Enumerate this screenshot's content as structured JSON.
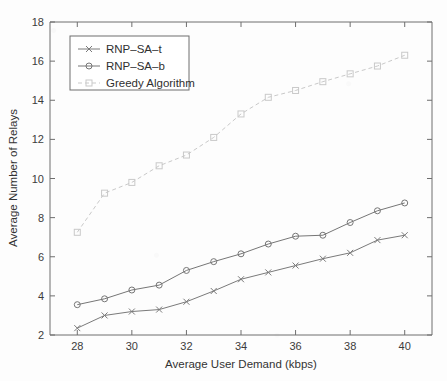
{
  "chart_data": {
    "type": "line",
    "title": "",
    "subtitle": "",
    "xlabel": "Average User Demand (kbps)",
    "ylabel": "Average Number of Relays",
    "x": [
      28,
      29,
      30,
      31,
      32,
      33,
      34,
      35,
      36,
      37,
      38,
      39,
      40
    ],
    "xlim": [
      27,
      41
    ],
    "ylim": [
      2,
      18
    ],
    "xticks": [
      28,
      30,
      32,
      34,
      36,
      38,
      40
    ],
    "yticks": [
      2,
      4,
      6,
      8,
      10,
      12,
      14,
      16,
      18
    ],
    "xticklabels": [
      "28",
      "30",
      "32",
      "34",
      "36",
      "38",
      "40"
    ],
    "yticklabels": [
      "2",
      "4",
      "6",
      "8",
      "10",
      "12",
      "14",
      "16",
      "18"
    ],
    "grid": false,
    "legend_position": "upper left",
    "series": [
      {
        "name": "RNP–SA–t",
        "marker": "x",
        "linestyle": "solid",
        "color": "#7a7a7a",
        "values": [
          2.35,
          3.0,
          3.2,
          3.3,
          3.7,
          4.25,
          4.85,
          5.2,
          5.55,
          5.9,
          6.2,
          6.85,
          7.1
        ]
      },
      {
        "name": "RNP–SA–b",
        "marker": "circle",
        "linestyle": "solid",
        "color": "#767676",
        "values": [
          3.55,
          3.85,
          4.3,
          4.55,
          5.3,
          5.75,
          6.15,
          6.65,
          7.05,
          7.1,
          7.75,
          8.35,
          8.75
        ]
      },
      {
        "name": "Greedy Algorithm",
        "marker": "square",
        "linestyle": "dashed",
        "color": "#c9c9c9",
        "values": [
          7.25,
          9.25,
          9.8,
          10.65,
          11.2,
          12.1,
          13.3,
          14.15,
          14.5,
          14.95,
          15.35,
          15.75,
          16.3
        ]
      }
    ]
  },
  "legend": {
    "entries": [
      {
        "label": "RNP–SA–t"
      },
      {
        "label": "RNP–SA–b"
      },
      {
        "label": "Greedy Algorithm"
      }
    ]
  },
  "axes": {
    "x_title": "Average User Demand (kbps)",
    "y_title": "Average Number of Relays"
  },
  "colors": {
    "axis": "#6e6e6e",
    "text": "#333333",
    "series_t": "#7a7a7a",
    "series_b": "#767676",
    "series_greedy": "#c9c9c9",
    "background": "#fdfdfd"
  }
}
